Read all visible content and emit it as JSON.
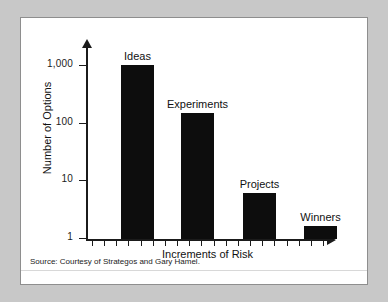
{
  "figure": {
    "source_note": "Source: Courtesy of Strategos and Gary Hamel.",
    "frame_color": "#8e8e8e",
    "background_color": "#ffffff",
    "page_background": "#c8c8c8",
    "bar_color": "#0d0d0d",
    "axis_color": "#1b1b1b"
  },
  "chart_data": {
    "type": "bar",
    "title": "",
    "subtitle": "",
    "xlabel": "Increments of Risk",
    "ylabel": "Number of Options",
    "yscale": "log",
    "ylim": [
      1,
      1000
    ],
    "ytick_labels": [
      "1,000",
      "100",
      "10",
      "1"
    ],
    "ytick_values": [
      1000,
      100,
      10,
      1
    ],
    "categories": [
      "Ideas",
      "Experiments",
      "Projects",
      "Winners"
    ],
    "values": [
      1000,
      150,
      6,
      1.6
    ],
    "bar_labels": [
      "Ideas",
      "Experiments",
      "Projects",
      "Winners"
    ],
    "grid": false,
    "legend": false,
    "x_minor_tick_count": 20,
    "annotations": [
      "Source: Courtesy of Strategos and Gary Hamel."
    ]
  }
}
